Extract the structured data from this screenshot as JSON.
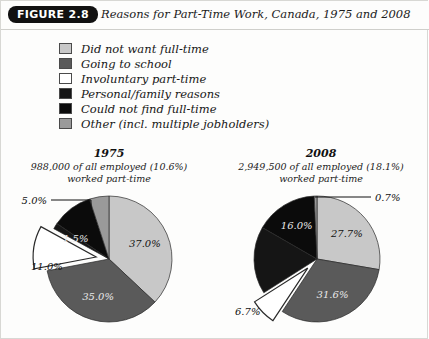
{
  "header": {
    "badge": "FIGURE 2.8",
    "title": "Reasons for Part-Time Work, Canada, 1975 and 2008"
  },
  "legend": {
    "items": [
      {
        "label": "Did not want full-time",
        "color": "#c8c8c8"
      },
      {
        "label": "Going to school",
        "color": "#5a5a5a"
      },
      {
        "label": "Involuntary part-time",
        "color": "#ffffff"
      },
      {
        "label": "Personal/family reasons",
        "color": "#151515"
      },
      {
        "label": "Could not find full-time",
        "color": "#0b0b0b"
      },
      {
        "label": "Other (incl. multiple jobholders)",
        "color": "#9a9a9a"
      }
    ]
  },
  "charts": {
    "c1975": {
      "year": "1975",
      "subtitle_line1": "988,000 of all employed (10.6%)",
      "subtitle_line2": "worked part-time",
      "callouts": [
        {
          "name": "other-callout",
          "text": "5.0%"
        },
        {
          "name": "involuntary-callout",
          "text": "11.0%"
        }
      ]
    },
    "c2008": {
      "year": "2008",
      "subtitle_line1": "2,949,500 of all employed (18.1%)",
      "subtitle_line2": "worked part-time",
      "callouts": [
        {
          "name": "other-callout",
          "text": "0.7%"
        },
        {
          "name": "involuntary-callout",
          "text": "6.7%"
        }
      ]
    }
  },
  "chart_data": [
    {
      "type": "pie",
      "title": "1975",
      "subtitle": "988,000 of all employed (10.6%) worked part-time",
      "categories": [
        "Did not want full-time",
        "Going to school",
        "Involuntary part-time",
        "Personal/family reasons",
        "Could not find full-time",
        "Other (incl. multiple jobholders)"
      ],
      "values": [
        37.0,
        35.0,
        11.0,
        1.5,
        10.5,
        5.0
      ],
      "labels": [
        "37.0%",
        "35.0%",
        "11.0%",
        "1.5%",
        "",
        "5.0%"
      ],
      "colors": [
        "#c8c8c8",
        "#5a5a5a",
        "#ffffff",
        "#151515",
        "#0b0b0b",
        "#9a9a9a"
      ],
      "exploded": [
        "Involuntary part-time"
      ],
      "legend_position": "top",
      "units": "percent"
    },
    {
      "type": "pie",
      "title": "2008",
      "subtitle": "2,949,500 of all employed (18.1%) worked part-time",
      "categories": [
        "Did not want full-time",
        "Going to school",
        "Involuntary part-time",
        "Personal/family reasons",
        "Could not find full-time",
        "Other (incl. multiple jobholders)"
      ],
      "values": [
        27.7,
        31.6,
        6.7,
        17.3,
        16.0,
        0.7
      ],
      "labels": [
        "27.7%",
        "31.6%",
        "6.7%",
        "",
        "16.0%",
        "0.7%"
      ],
      "colors": [
        "#c8c8c8",
        "#5a5a5a",
        "#ffffff",
        "#151515",
        "#0b0b0b",
        "#9a9a9a"
      ],
      "exploded": [
        "Involuntary part-time"
      ],
      "legend_position": "top",
      "units": "percent"
    }
  ]
}
